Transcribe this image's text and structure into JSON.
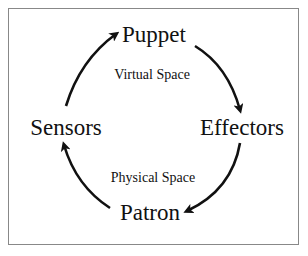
{
  "diagram": {
    "type": "cycle",
    "nodes": [
      {
        "id": "puppet",
        "label": "Puppet"
      },
      {
        "id": "effectors",
        "label": "Effectors"
      },
      {
        "id": "patron",
        "label": "Patron"
      },
      {
        "id": "sensors",
        "label": "Sensors"
      }
    ],
    "regions": [
      {
        "id": "virtual",
        "label": "Virtual Space"
      },
      {
        "id": "physical",
        "label": "Physical Space"
      }
    ],
    "edges": [
      {
        "from": "sensors",
        "to": "puppet"
      },
      {
        "from": "puppet",
        "to": "effectors"
      },
      {
        "from": "effectors",
        "to": "patron"
      },
      {
        "from": "patron",
        "to": "sensors"
      }
    ],
    "colors": {
      "ink": "#111111",
      "frame": "#888888",
      "background": "#ffffff"
    }
  }
}
